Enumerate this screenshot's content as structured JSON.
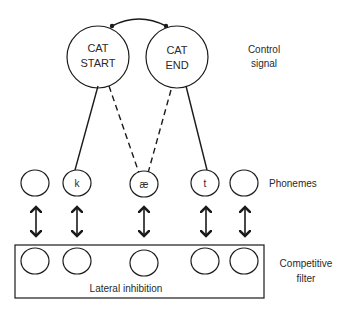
{
  "control_nodes": [
    {
      "line1": "CAT",
      "line2": "START"
    },
    {
      "line1": "CAT",
      "line2": "END"
    }
  ],
  "labels": {
    "control_signal_1": "Control",
    "control_signal_2": "signal",
    "phonemes": "Phonemes",
    "competitive_filter_1": "Competitive",
    "competitive_filter_2": "filter",
    "lateral_inhibition": "Lateral inhibition"
  },
  "phonemes": [
    "",
    "k",
    "æ",
    "t",
    ""
  ],
  "colors": {
    "stroke": "#1a1a1a",
    "text": "#2a2a2a",
    "background": "#ffffff"
  }
}
